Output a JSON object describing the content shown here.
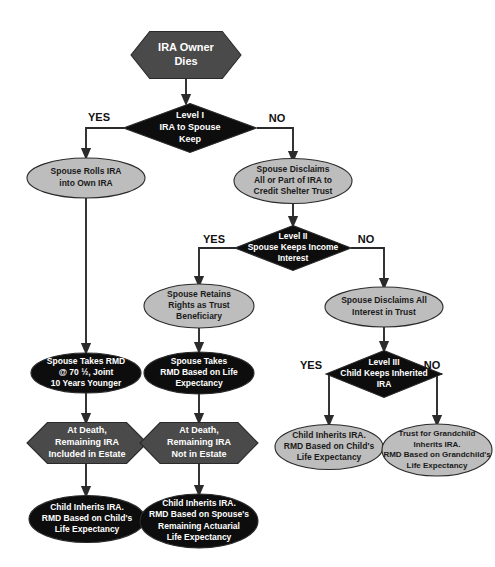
{
  "diagram": {
    "colors": {
      "dark_gray": "#4a4a4a",
      "black": "#0d0d0d",
      "light_gray": "#bdbdbd",
      "outline": "#2a2a2a",
      "connector": "#2b2b2b",
      "label_light": "#ffffff",
      "label_dark": "#1a1a1a",
      "background": "#ffffff"
    },
    "nodes": [
      {
        "id": "ira-owner-dies",
        "shape": "hexagon",
        "fill": "dark_gray",
        "text_color": "light",
        "x": 186,
        "y": 55,
        "w": 110,
        "h": 47,
        "font_size": 11,
        "lines": [
          "IRA Owner",
          "Dies"
        ]
      },
      {
        "id": "level-1",
        "shape": "diamond",
        "fill": "black",
        "text_color": "light",
        "x": 190,
        "y": 128,
        "w": 133,
        "h": 49,
        "font_size": 9,
        "lines": [
          "Level I",
          "IRA to Spouse",
          "Keep"
        ]
      },
      {
        "id": "spouse-rolls-ira",
        "shape": "ellipse",
        "fill": "light_gray",
        "text_color": "dark",
        "x": 86,
        "y": 178,
        "w": 118,
        "h": 40,
        "font_size": 8.5,
        "lines": [
          "Spouse Rolls IRA",
          "into Own IRA"
        ]
      },
      {
        "id": "spouse-disclaims-part",
        "shape": "ellipse",
        "fill": "light_gray",
        "text_color": "dark",
        "x": 293,
        "y": 181,
        "w": 118,
        "h": 45,
        "font_size": 8.5,
        "lines": [
          "Spouse Disclaims",
          "All or Part of IRA to",
          "Credit Shelter Trust"
        ]
      },
      {
        "id": "level-2",
        "shape": "diamond",
        "fill": "black",
        "text_color": "light",
        "x": 293,
        "y": 248,
        "w": 116,
        "h": 45,
        "font_size": 8.5,
        "lines": [
          "Level II",
          "Spouse Keeps Income",
          "Interest"
        ]
      },
      {
        "id": "spouse-retains-rights",
        "shape": "ellipse",
        "fill": "light_gray",
        "text_color": "dark",
        "x": 199,
        "y": 306,
        "w": 110,
        "h": 44,
        "font_size": 8.5,
        "lines": [
          "Spouse Retains",
          "Rights as Trust",
          "Beneficiary"
        ]
      },
      {
        "id": "spouse-disclaims-all",
        "shape": "ellipse",
        "fill": "light_gray",
        "text_color": "dark",
        "x": 384,
        "y": 307,
        "w": 118,
        "h": 40,
        "font_size": 8.5,
        "lines": [
          "Spouse Disclaims All",
          "Interest in Trust"
        ]
      },
      {
        "id": "spouse-takes-rmd-70",
        "shape": "ellipse",
        "fill": "black",
        "text_color": "light",
        "x": 86,
        "y": 373,
        "w": 110,
        "h": 40,
        "font_size": 8.5,
        "lines": [
          "Spouse Takes RMD",
          "@ 70 ½, Joint",
          "10 Years Younger"
        ]
      },
      {
        "id": "spouse-takes-rmd-life",
        "shape": "ellipse",
        "fill": "black",
        "text_color": "light",
        "x": 199,
        "y": 373,
        "w": 110,
        "h": 42,
        "font_size": 8.5,
        "lines": [
          "Spouse Takes",
          "RMD Based on Life",
          "Expectancy"
        ]
      },
      {
        "id": "level-3",
        "shape": "diamond",
        "fill": "black",
        "text_color": "light",
        "x": 384,
        "y": 374,
        "w": 116,
        "h": 47,
        "font_size": 8.5,
        "lines": [
          "Level III",
          "Child Keeps Inherited",
          "IRA"
        ]
      },
      {
        "id": "at-death-included",
        "shape": "hexagon",
        "fill": "dark_gray",
        "text_color": "light",
        "x": 87,
        "y": 443,
        "w": 120,
        "h": 41,
        "font_size": 9,
        "lines": [
          "At Death,",
          "Remaining IRA",
          "Included in Estate"
        ]
      },
      {
        "id": "at-death-not-included",
        "shape": "hexagon",
        "fill": "dark_gray",
        "text_color": "light",
        "x": 199,
        "y": 443,
        "w": 118,
        "h": 41,
        "font_size": 9,
        "lines": [
          "At Death,",
          "Remaining IRA",
          "Not in Estate"
        ]
      },
      {
        "id": "child-inherits-level3",
        "shape": "ellipse",
        "fill": "light_gray",
        "text_color": "dark",
        "x": 329,
        "y": 447,
        "w": 108,
        "h": 45,
        "font_size": 8.5,
        "lines": [
          "Child Inherits IRA.",
          "RMD Based on Child's",
          "Life Expectancy"
        ]
      },
      {
        "id": "trust-for-grandchild",
        "shape": "ellipse",
        "fill": "light_gray",
        "text_color": "dark",
        "x": 437,
        "y": 450,
        "w": 110,
        "h": 52,
        "font_size": 8,
        "lines": [
          "Trust for Grandchild",
          "Inherits IRA.",
          "RMD Based on Grandchild's",
          "Life Expectancy"
        ]
      },
      {
        "id": "child-inherits-child-life",
        "shape": "ellipse",
        "fill": "black",
        "text_color": "light",
        "x": 87,
        "y": 519,
        "w": 116,
        "h": 47,
        "font_size": 8.5,
        "lines": [
          "Child Inherits IRA.",
          "RMD Based on Child's",
          "Life Expectancy"
        ]
      },
      {
        "id": "child-inherits-spouse-actuarial",
        "shape": "ellipse",
        "fill": "black",
        "text_color": "light",
        "x": 199,
        "y": 521,
        "w": 118,
        "h": 54,
        "font_size": 8.5,
        "lines": [
          "Child Inherits IRA.",
          "RMD Based on Spouse's",
          "Remaining Actuarial",
          "Life Expectancy"
        ]
      }
    ],
    "branch_labels": [
      {
        "id": "level1-yes",
        "text": "YES",
        "x": 99,
        "y": 118
      },
      {
        "id": "level1-no",
        "text": "NO",
        "x": 277,
        "y": 119
      },
      {
        "id": "level2-yes",
        "text": "YES",
        "x": 214,
        "y": 240
      },
      {
        "id": "level2-no",
        "text": "NO",
        "x": 366,
        "y": 240
      },
      {
        "id": "level3-yes",
        "text": "YES",
        "x": 311,
        "y": 366
      },
      {
        "id": "level3-no",
        "text": "NO",
        "x": 432,
        "y": 366
      }
    ],
    "connectors": [
      {
        "id": "dies-to-level1",
        "path": "M186,79 L186,100"
      },
      {
        "id": "level1-to-yes",
        "path": "M124,128 L86,128 L86,154"
      },
      {
        "id": "level1-to-no",
        "path": "M257,128 L293,128 L293,157"
      },
      {
        "id": "spouse-disclaims-to-level2",
        "path": "M293,204 L293,222"
      },
      {
        "id": "level2-to-yes",
        "path": "M236,248 L199,248 L199,282"
      },
      {
        "id": "level2-to-no",
        "path": "M351,248 L384,248 L384,284"
      },
      {
        "id": "retains-to-rmd-life",
        "path": "M199,328 L199,348"
      },
      {
        "id": "disclaims-all-to-level3",
        "path": "M384,327 L384,347"
      },
      {
        "id": "level3-to-yes",
        "path": "M327,374 L329,374 L329,421"
      },
      {
        "id": "level3-to-no",
        "path": "M442,374 L437,374 L437,421"
      },
      {
        "id": "rolls-to-rmd70",
        "path": "M86,198 L86,349"
      },
      {
        "id": "rmd70-to-atdeath",
        "path": "M86,393 L86,419"
      },
      {
        "id": "rmdlife-to-atdeath",
        "path": "M199,394 L199,419"
      },
      {
        "id": "atdeath-in-to-child",
        "path": "M86,464 L86,492"
      },
      {
        "id": "atdeath-notin-to-child",
        "path": "M199,464 L199,491"
      }
    ]
  }
}
